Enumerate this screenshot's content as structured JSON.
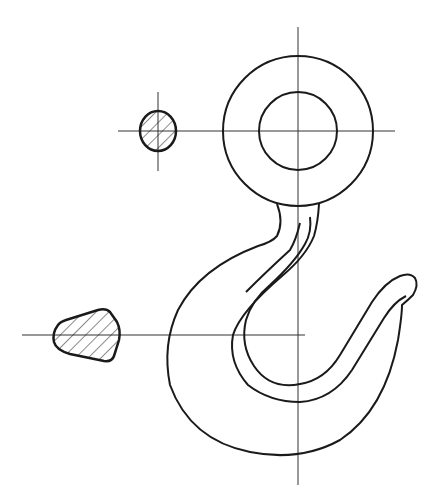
{
  "diagram": {
    "type": "technical-drawing",
    "colors": {
      "line": "#1a1a1a",
      "centerline": "#333333",
      "background": "#ffffff"
    },
    "components": [
      {
        "id": "eye-ring",
        "label": "eye ring (outer and inner circles)"
      },
      {
        "id": "hook-body",
        "label": "hook body profile"
      },
      {
        "id": "round-section",
        "label": "circular hatched cross section"
      },
      {
        "id": "trapezoid-section",
        "label": "trapezoidal hatched cross section"
      }
    ]
  }
}
